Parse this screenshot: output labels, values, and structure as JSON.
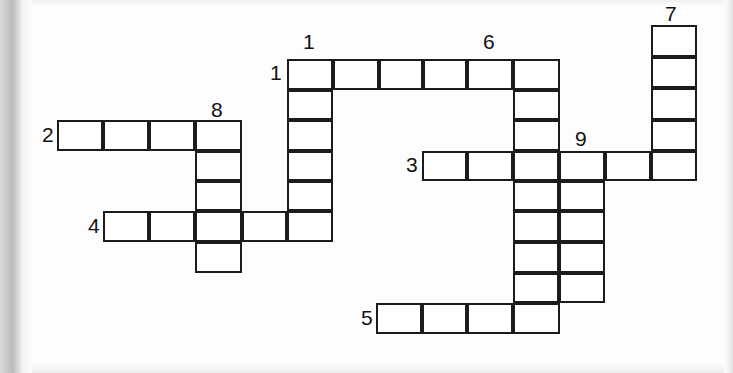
{
  "puzzle": {
    "kind": "crossword-grid",
    "title": "",
    "cell_width": 46,
    "cell_height": 30.6,
    "origin_x": 57,
    "origin_y": 59,
    "grid_color": "#1c1c1c",
    "cell_fill": "#ffffff",
    "page_color": "#fdfdfd",
    "columns_px": [
      57,
      103,
      149,
      195,
      241,
      287,
      333,
      376,
      422,
      467,
      513,
      559,
      605,
      651,
      697
    ],
    "rows_px": [
      25,
      59,
      90,
      120,
      150,
      181,
      211,
      242,
      272,
      303,
      334
    ],
    "clue_numbers": [
      {
        "label": "1",
        "kind": "across",
        "x": 270,
        "y": 62
      },
      {
        "label": "2",
        "kind": "across",
        "x": 42,
        "y": 124
      },
      {
        "label": "3",
        "kind": "across",
        "x": 406,
        "y": 154
      },
      {
        "label": "4",
        "kind": "across",
        "x": 88,
        "y": 215
      },
      {
        "label": "5",
        "kind": "across",
        "x": 361,
        "y": 307
      },
      {
        "label": "1",
        "kind": "down",
        "x": 303,
        "y": 31
      },
      {
        "label": "6",
        "kind": "down",
        "x": 483,
        "y": 31
      },
      {
        "label": "7",
        "kind": "down",
        "x": 665,
        "y": 3
      },
      {
        "label": "8",
        "kind": "down",
        "x": 211,
        "y": 99
      },
      {
        "label": "9",
        "kind": "down",
        "x": 575,
        "y": 128
      }
    ],
    "entries": [
      {
        "name": "1-across",
        "number": "1",
        "direction": "across",
        "length": 6,
        "start_col": 5,
        "start_row": 1
      },
      {
        "name": "2-across",
        "number": "2",
        "direction": "across",
        "length": 4,
        "start_col": 0,
        "start_row": 3
      },
      {
        "name": "3-across",
        "number": "3",
        "direction": "across",
        "length": 6,
        "start_col": 8,
        "start_row": 4
      },
      {
        "name": "4-across",
        "number": "4",
        "direction": "across",
        "length": 5,
        "start_col": 1,
        "start_row": 6
      },
      {
        "name": "5-across",
        "number": "5",
        "direction": "across",
        "length": 4,
        "start_col": 7,
        "start_row": 9
      },
      {
        "name": "1-down",
        "number": "1",
        "direction": "down",
        "length": 6,
        "start_col": 5,
        "start_row": 1
      },
      {
        "name": "6-down",
        "number": "6",
        "direction": "down",
        "length": 9,
        "start_col": 10,
        "start_row": 1
      },
      {
        "name": "7-down",
        "number": "7",
        "direction": "down",
        "length": 5,
        "start_col": 13,
        "start_row": 0
      },
      {
        "name": "8-down",
        "number": "8",
        "direction": "down",
        "length": 5,
        "start_col": 4,
        "start_row": 3
      },
      {
        "name": "9-down",
        "number": "9",
        "direction": "down",
        "length": 5,
        "start_col": 11,
        "start_row": 4
      }
    ],
    "cells": [
      {
        "name": "cell-r1c5",
        "x": 287,
        "y": 59,
        "w": 46,
        "h": 31
      },
      {
        "name": "cell-r1c6",
        "x": 333,
        "y": 59,
        "w": 46,
        "h": 31
      },
      {
        "name": "cell-r1c7",
        "x": 379,
        "y": 59,
        "w": 44,
        "h": 31
      },
      {
        "name": "cell-r1c8",
        "x": 423,
        "y": 59,
        "w": 44,
        "h": 31
      },
      {
        "name": "cell-r1c9",
        "x": 467,
        "y": 59,
        "w": 46,
        "h": 31
      },
      {
        "name": "cell-r1c10",
        "x": 513,
        "y": 59,
        "w": 47,
        "h": 31
      },
      {
        "name": "cell-r2c5",
        "x": 287,
        "y": 90,
        "w": 46,
        "h": 30
      },
      {
        "name": "cell-r2c10",
        "x": 513,
        "y": 90,
        "w": 47,
        "h": 30
      },
      {
        "name": "cell-r3c0",
        "x": 57,
        "y": 120,
        "w": 46,
        "h": 31
      },
      {
        "name": "cell-r3c1",
        "x": 103,
        "y": 120,
        "w": 46,
        "h": 31
      },
      {
        "name": "cell-r3c2",
        "x": 149,
        "y": 120,
        "w": 46,
        "h": 31
      },
      {
        "name": "cell-r3c3",
        "x": 195,
        "y": 120,
        "w": 47,
        "h": 31
      },
      {
        "name": "cell-r3c5",
        "x": 287,
        "y": 120,
        "w": 46,
        "h": 31
      },
      {
        "name": "cell-r3c10",
        "x": 513,
        "y": 120,
        "w": 47,
        "h": 31
      },
      {
        "name": "cell-r4c3",
        "x": 195,
        "y": 151,
        "w": 47,
        "h": 30
      },
      {
        "name": "cell-r4c5",
        "x": 287,
        "y": 151,
        "w": 46,
        "h": 30
      },
      {
        "name": "cell-r4c8",
        "x": 422,
        "y": 151,
        "w": 45,
        "h": 30
      },
      {
        "name": "cell-r4c9",
        "x": 467,
        "y": 151,
        "w": 46,
        "h": 30
      },
      {
        "name": "cell-r4c10",
        "x": 513,
        "y": 151,
        "w": 46,
        "h": 30
      },
      {
        "name": "cell-r4c11",
        "x": 559,
        "y": 151,
        "w": 46,
        "h": 30
      },
      {
        "name": "cell-r4c12",
        "x": 605,
        "y": 151,
        "w": 46,
        "h": 30
      },
      {
        "name": "cell-r4c13",
        "x": 651,
        "y": 151,
        "w": 46,
        "h": 30
      },
      {
        "name": "cell-r5c3",
        "x": 195,
        "y": 181,
        "w": 47,
        "h": 30
      },
      {
        "name": "cell-r5c5",
        "x": 287,
        "y": 181,
        "w": 46,
        "h": 30
      },
      {
        "name": "cell-r5c10",
        "x": 513,
        "y": 181,
        "w": 46,
        "h": 30
      },
      {
        "name": "cell-r5c11",
        "x": 559,
        "y": 181,
        "w": 46,
        "h": 30
      },
      {
        "name": "cell-r6c1",
        "x": 103,
        "y": 211,
        "w": 46,
        "h": 31
      },
      {
        "name": "cell-r6c2",
        "x": 149,
        "y": 211,
        "w": 46,
        "h": 31
      },
      {
        "name": "cell-r6c3",
        "x": 195,
        "y": 211,
        "w": 47,
        "h": 31
      },
      {
        "name": "cell-r6c4",
        "x": 242,
        "y": 211,
        "w": 45,
        "h": 31
      },
      {
        "name": "cell-r6c5",
        "x": 287,
        "y": 211,
        "w": 46,
        "h": 31
      },
      {
        "name": "cell-r6c10",
        "x": 513,
        "y": 211,
        "w": 46,
        "h": 31
      },
      {
        "name": "cell-r6c11",
        "x": 559,
        "y": 211,
        "w": 46,
        "h": 31
      },
      {
        "name": "cell-r7c3",
        "x": 195,
        "y": 242,
        "w": 47,
        "h": 31
      },
      {
        "name": "cell-r7c10",
        "x": 513,
        "y": 242,
        "w": 46,
        "h": 31
      },
      {
        "name": "cell-r7c11",
        "x": 559,
        "y": 242,
        "w": 46,
        "h": 31
      },
      {
        "name": "cell-r8c10",
        "x": 513,
        "y": 273,
        "w": 46,
        "h": 30
      },
      {
        "name": "cell-r8c11",
        "x": 559,
        "y": 273,
        "w": 46,
        "h": 30
      },
      {
        "name": "cell-r9c7",
        "x": 376,
        "y": 303,
        "w": 46,
        "h": 31
      },
      {
        "name": "cell-r9c8",
        "x": 422,
        "y": 303,
        "w": 45,
        "h": 31
      },
      {
        "name": "cell-r9c9",
        "x": 467,
        "y": 303,
        "w": 46,
        "h": 31
      },
      {
        "name": "cell-r9c10",
        "x": 513,
        "y": 303,
        "w": 47,
        "h": 31
      },
      {
        "name": "cell-r0c13",
        "x": 651,
        "y": 25,
        "w": 46,
        "h": 32
      },
      {
        "name": "cell-r1c13",
        "x": 651,
        "y": 57,
        "w": 46,
        "h": 31
      },
      {
        "name": "cell-r2c13",
        "x": 651,
        "y": 88,
        "w": 46,
        "h": 32
      },
      {
        "name": "cell-r3c13",
        "x": 651,
        "y": 120,
        "w": 46,
        "h": 31
      }
    ]
  }
}
